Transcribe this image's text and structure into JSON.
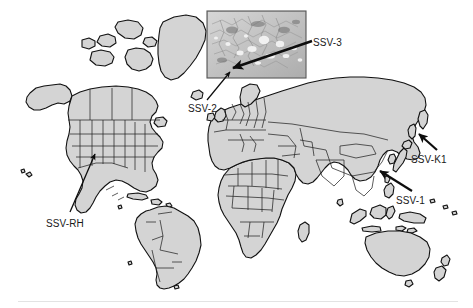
{
  "figure": {
    "type": "world-map-with-annotations",
    "background_color": "#ffffff",
    "land_fill_color": "#d4d4d4",
    "border_color": "#1a1a1a",
    "coastline_color": "#111111",
    "label_color": "#1a1a1a",
    "rule_color": "#e3e3e3"
  },
  "inset": {
    "name": "satellite-terrain-inset",
    "bounds": {
      "x": 207,
      "y": 11,
      "width": 99,
      "height": 67
    },
    "border_color": "#555555",
    "description": "grayscale satellite terrain image",
    "arrow": {
      "from_x": 312,
      "from_y": 41,
      "to_x": 231,
      "to_y": 69
    }
  },
  "annotations": [
    {
      "id": "ssv-3",
      "label": "SSV-3",
      "label_x": 313,
      "label_y": 38,
      "arrow": {
        "from_x": 312,
        "from_y": 41,
        "to_x": 231,
        "to_y": 69
      },
      "arrow_weight": "thick"
    },
    {
      "id": "ssv-2",
      "label": "SSV-2",
      "label_x": 188,
      "label_y": 104,
      "arrow": {
        "from_x": 208,
        "from_y": 100,
        "to_x": 230,
        "to_y": 71
      },
      "arrow_weight": "thin"
    },
    {
      "id": "ssv-k1",
      "label": "SSV-K1",
      "label_x": 411,
      "label_y": 155,
      "arrow": {
        "from_x": 437,
        "from_y": 150,
        "to_x": 418,
        "to_y": 133
      },
      "arrow_weight": "thick"
    },
    {
      "id": "ssv-1",
      "label": "SSV-1",
      "label_x": 396,
      "label_y": 196,
      "arrow": {
        "from_x": 412,
        "from_y": 191,
        "to_x": 379,
        "to_y": 170
      },
      "arrow_weight": "thick"
    },
    {
      "id": "ssv-rh",
      "label": "SSV-RH",
      "label_x": 46,
      "label_y": 219,
      "arrow": {
        "from_x": 70,
        "from_y": 213,
        "to_x": 94,
        "to_y": 153
      },
      "arrow_weight": "thin"
    }
  ],
  "bottom_rule": {
    "x": 18,
    "y": 301,
    "width": 440
  }
}
